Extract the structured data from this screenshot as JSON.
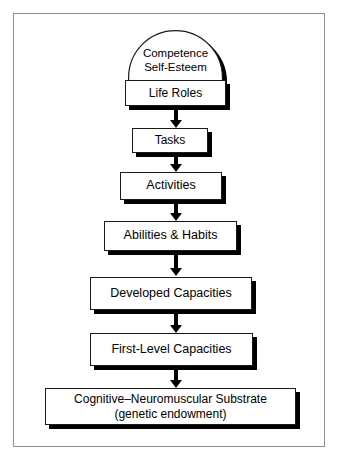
{
  "diagram": {
    "type": "flowchart",
    "orientation": "top-to-bottom",
    "colors": {
      "background": "#ffffff",
      "box_fill": "#ffffff",
      "box_border": "#1a1a1a",
      "shadow": "#000000",
      "frame_border": "#8f8f8f",
      "text": "#000000"
    },
    "frame": {
      "present": true
    },
    "dome": {
      "name": "competence-self-esteem-dome",
      "label": "Competence\nSelf-Esteem",
      "line1": "Competence",
      "line2": "Self-Esteem",
      "shape": "semicircular-arch"
    },
    "nodes": [
      {
        "id": "life-roles",
        "label": "Life Roles",
        "level": 1
      },
      {
        "id": "tasks",
        "label": "Tasks",
        "level": 2
      },
      {
        "id": "activities",
        "label": "Activities",
        "level": 3
      },
      {
        "id": "abilities-habits",
        "label": "Abilities & Habits",
        "level": 4
      },
      {
        "id": "developed-capacities",
        "label": "Developed Capacities",
        "level": 5
      },
      {
        "id": "first-level-capacities",
        "label": "First-Level Capacities",
        "level": 6
      },
      {
        "id": "cognitive-neuromuscular-substrate",
        "label": "Cognitive–Neuromuscular Substrate\n(genetic endowment)",
        "level": 7
      }
    ],
    "arrows": [
      {
        "from": "life-roles",
        "to": "tasks",
        "direction": "down"
      },
      {
        "from": "tasks",
        "to": "activities",
        "direction": "down"
      },
      {
        "from": "activities",
        "to": "abilities-habits",
        "direction": "down"
      },
      {
        "from": "abilities-habits",
        "to": "developed-capacities",
        "direction": "down"
      },
      {
        "from": "developed-capacities",
        "to": "first-level-capacities",
        "direction": "down"
      },
      {
        "from": "first-level-capacities",
        "to": "cognitive-neuromuscular-substrate",
        "direction": "down"
      }
    ]
  }
}
